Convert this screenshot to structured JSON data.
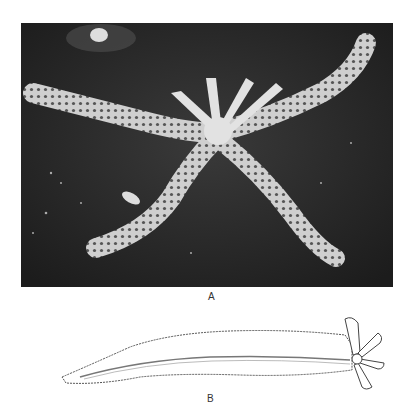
{
  "figure": {
    "panels": [
      {
        "id": "A",
        "label": "A",
        "type": "photograph",
        "subject": "starfish"
      },
      {
        "id": "B",
        "label": "B",
        "type": "line-drawing",
        "subject": "starfish arm with small regenerating disc"
      }
    ]
  },
  "colors": {
    "photo_background": "#2a2a2a",
    "starfish": "#d8d8d8",
    "ink": "#444444"
  }
}
